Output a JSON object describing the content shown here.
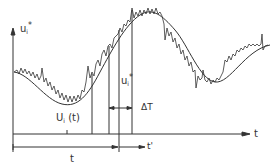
{
  "diagram": {
    "type": "time-series schematic",
    "y_axis_label": "u",
    "y_axis_label_sub": "i",
    "y_axis_label_sup": "*",
    "x_axis_label": "t",
    "curve_label_main": "U",
    "curve_label_sub": "i",
    "curve_label_arg": "(t)",
    "instant_label": "u",
    "instant_label_sub": "i",
    "instant_label_sup": "*",
    "window_label": "ΔT",
    "time_span_label": "t",
    "shifted_time_label": "t'",
    "colors": {
      "line": "#333333",
      "background": "#ffffff"
    }
  }
}
